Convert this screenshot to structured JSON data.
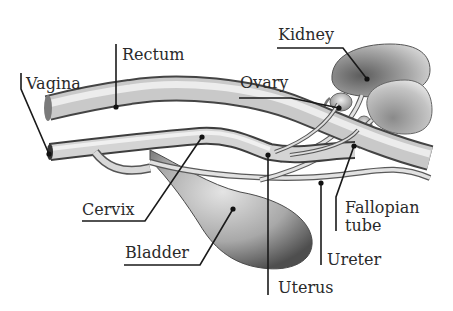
{
  "diagram": {
    "labels": {
      "kidney": "Kidney",
      "rectum": "Rectum",
      "vagina": "Vagina",
      "ovary": "Ovary",
      "cervix": "Cervix",
      "bladder": "Bladder",
      "fallopian_line1": "Fallopian",
      "fallopian_line2": "tube",
      "ureter": "Ureter",
      "uterus": "Uterus"
    },
    "colors": {
      "background": "#ffffff",
      "ink": "#1a1a1a",
      "organ_shade_dark": "#6e6e6e",
      "organ_shade_light": "#e8e8e8"
    }
  }
}
